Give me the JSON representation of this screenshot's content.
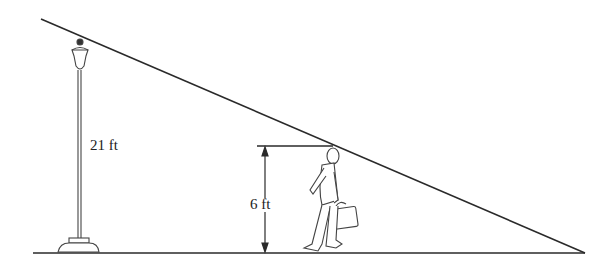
{
  "diagram": {
    "lamp_height_label": "21 ft",
    "person_height_label": "6 ft",
    "colors": {
      "line": "#2a2a2a",
      "background": "#ffffff"
    }
  }
}
